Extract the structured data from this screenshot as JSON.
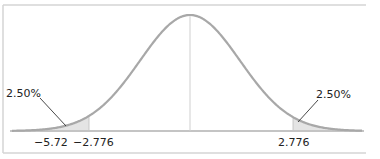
{
  "chart_data": {
    "type": "area",
    "title": "",
    "xlabel": "",
    "ylabel": "",
    "grid": false,
    "legend": null,
    "tick_labels": [
      "-5.72",
      "-2.776",
      "2.776"
    ],
    "critical_values": {
      "lower": -2.776,
      "upper": 2.776
    },
    "marked_value": -5.72,
    "tails": [
      {
        "side": "left",
        "area_label": "2.50%",
        "from": "-inf",
        "to": -2.776
      },
      {
        "side": "right",
        "area_label": "2.50%",
        "from": 2.776,
        "to": "inf"
      }
    ],
    "colors": {
      "curve": "#a6a6a6",
      "shade": "#e4e4e4",
      "axis": "#bfbfbf",
      "frame": "#d0d0d0",
      "text": "#222222"
    }
  },
  "labels": {
    "left_area": "2.50%",
    "right_area": "2.50%",
    "tick_neg572": "−5.72",
    "tick_neg2776": "−2.776",
    "tick_pos2776": "2.776"
  }
}
